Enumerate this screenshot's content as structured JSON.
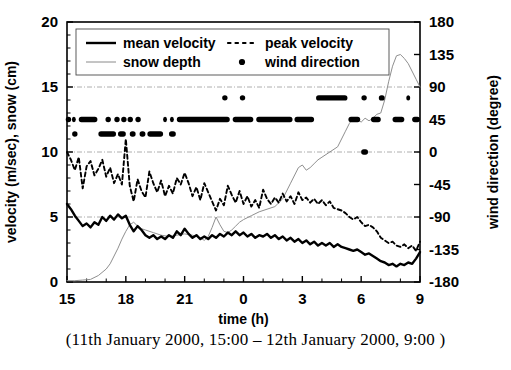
{
  "figure": {
    "caption": "(11th January 2000, 15:00 – 12th January 2000, 9:00 )"
  },
  "chart_data": {
    "type": "line",
    "title": "",
    "xlabel": "time (h)",
    "ylabel": "velocity (m/sec), snow (cm)",
    "y2label": "wind direction (degree)",
    "xlim": [
      15,
      33
    ],
    "ylim": [
      0,
      20
    ],
    "y2lim": [
      -180,
      180
    ],
    "xticks": [
      15,
      18,
      21,
      24,
      27,
      30,
      33
    ],
    "xticklabels": [
      "15",
      "18",
      "21",
      "0",
      "3",
      "6",
      "9"
    ],
    "yticks": [
      0,
      5,
      10,
      15,
      20
    ],
    "yticklabels": [
      "0",
      "5",
      "10",
      "15",
      "20"
    ],
    "y2ticks": [
      -180,
      -135,
      -90,
      -45,
      0,
      45,
      90,
      135,
      180
    ],
    "y2ticklabels": [
      "-180",
      "-135",
      "-90",
      "-45",
      "0",
      "45",
      "90",
      "135",
      "180"
    ],
    "grid": true,
    "gridlines_y": [
      5,
      10,
      15
    ],
    "legend_position": "upper-left-inside",
    "legend": [
      {
        "label": "mean velocity",
        "style": "solid-thick",
        "color": "#000000"
      },
      {
        "label": "peak velocity",
        "style": "dotted",
        "color": "#000000"
      },
      {
        "label": "snow depth",
        "style": "thin-light",
        "color": "#8a8a8a"
      },
      {
        "label": "wind direction",
        "style": "dot-marker",
        "color": "#000000"
      }
    ],
    "series": [
      {
        "name": "mean velocity",
        "axis": "left",
        "x": [
          15.0,
          15.2,
          15.4,
          15.6,
          15.8,
          16.0,
          16.2,
          16.4,
          16.6,
          16.8,
          17.0,
          17.2,
          17.4,
          17.6,
          17.8,
          18.0,
          18.2,
          18.4,
          18.6,
          18.8,
          19.0,
          19.2,
          19.4,
          19.6,
          19.8,
          20.0,
          20.2,
          20.4,
          20.6,
          20.8,
          21.0,
          21.2,
          21.4,
          21.6,
          21.8,
          22.0,
          22.2,
          22.4,
          22.6,
          22.8,
          23.0,
          23.2,
          23.4,
          23.6,
          23.8,
          24.0,
          24.2,
          24.4,
          24.6,
          24.8,
          25.0,
          25.2,
          25.4,
          25.6,
          25.8,
          26.0,
          26.2,
          26.4,
          26.6,
          26.8,
          27.0,
          27.2,
          27.4,
          27.6,
          27.8,
          28.0,
          28.2,
          28.4,
          28.6,
          28.8,
          29.0,
          29.2,
          29.4,
          29.6,
          29.8,
          30.0,
          30.2,
          30.4,
          30.6,
          30.8,
          31.0,
          31.2,
          31.4,
          31.6,
          31.8,
          32.0,
          32.2,
          32.4,
          32.6,
          32.8,
          33.0
        ],
        "values": [
          6.0,
          5.6,
          5.1,
          4.7,
          4.3,
          4.5,
          4.2,
          4.6,
          4.4,
          5.0,
          4.7,
          5.1,
          4.8,
          5.2,
          4.9,
          5.1,
          4.4,
          3.9,
          4.3,
          4.0,
          3.6,
          3.4,
          3.6,
          3.3,
          3.5,
          3.3,
          3.6,
          3.4,
          3.9,
          3.6,
          4.1,
          3.7,
          3.4,
          3.6,
          3.3,
          3.5,
          3.3,
          3.6,
          3.4,
          3.7,
          3.5,
          3.8,
          3.6,
          3.9,
          3.6,
          3.8,
          3.5,
          3.7,
          3.4,
          3.6,
          3.5,
          3.7,
          3.4,
          3.6,
          3.3,
          3.5,
          3.2,
          3.4,
          3.1,
          3.3,
          3.0,
          3.2,
          2.9,
          3.1,
          2.8,
          3.0,
          2.8,
          3.0,
          2.7,
          2.9,
          2.7,
          2.6,
          2.5,
          2.4,
          2.5,
          2.3,
          2.1,
          2.2,
          2.0,
          1.8,
          1.6,
          1.5,
          1.3,
          1.4,
          1.2,
          1.4,
          1.3,
          1.5,
          1.4,
          1.8,
          2.3
        ]
      },
      {
        "name": "peak velocity",
        "axis": "left",
        "x": [
          15.0,
          15.2,
          15.4,
          15.6,
          15.8,
          16.0,
          16.2,
          16.4,
          16.6,
          16.8,
          17.0,
          17.2,
          17.4,
          17.6,
          17.8,
          18.0,
          18.2,
          18.4,
          18.6,
          18.8,
          19.0,
          19.2,
          19.4,
          19.6,
          19.8,
          20.0,
          20.2,
          20.4,
          20.6,
          20.8,
          21.0,
          21.2,
          21.4,
          21.6,
          21.8,
          22.0,
          22.2,
          22.4,
          22.6,
          22.8,
          23.0,
          23.2,
          23.4,
          23.6,
          23.8,
          24.0,
          24.2,
          24.4,
          24.6,
          24.8,
          25.0,
          25.2,
          25.4,
          25.6,
          25.8,
          26.0,
          26.2,
          26.4,
          26.6,
          26.8,
          27.0,
          27.2,
          27.4,
          27.6,
          27.8,
          28.0,
          28.2,
          28.4,
          28.6,
          28.8,
          29.0,
          29.2,
          29.4,
          29.6,
          29.8,
          30.0,
          30.2,
          30.4,
          30.6,
          30.8,
          31.0,
          31.2,
          31.4,
          31.6,
          31.8,
          32.0,
          32.2,
          32.4,
          32.6,
          32.8,
          33.0
        ],
        "values": [
          10.0,
          9.4,
          8.6,
          9.6,
          7.2,
          8.9,
          9.3,
          8.2,
          8.7,
          9.4,
          8.1,
          8.8,
          7.6,
          8.3,
          7.5,
          11.0,
          7.4,
          6.2,
          7.9,
          7.0,
          6.5,
          8.5,
          7.6,
          6.9,
          7.8,
          6.6,
          7.4,
          6.8,
          8.0,
          7.5,
          8.4,
          7.6,
          6.6,
          7.3,
          6.3,
          7.6,
          6.9,
          6.2,
          5.5,
          6.4,
          5.9,
          7.4,
          6.7,
          6.1,
          7.0,
          6.0,
          6.6,
          5.8,
          6.3,
          5.7,
          7.1,
          6.4,
          6.0,
          6.5,
          6.1,
          6.8,
          6.2,
          6.6,
          6.0,
          6.9,
          6.3,
          6.5,
          6.1,
          6.4,
          6.0,
          6.3,
          5.9,
          6.2,
          5.7,
          5.6,
          5.5,
          5.3,
          5.0,
          4.8,
          5.0,
          4.6,
          4.3,
          4.4,
          4.2,
          3.9,
          3.4,
          3.2,
          3.0,
          3.1,
          2.8,
          2.7,
          2.9,
          2.6,
          2.8,
          2.4,
          3.1
        ]
      },
      {
        "name": "snow depth",
        "axis": "left",
        "x": [
          15.0,
          15.4,
          15.8,
          16.2,
          16.6,
          17.0,
          17.2,
          17.4,
          17.6,
          17.8,
          18.0,
          18.2,
          18.4,
          18.6,
          18.8,
          19.0,
          19.4,
          19.8,
          20.2,
          20.6,
          21.0,
          21.4,
          21.8,
          22.0,
          22.2,
          22.4,
          22.6,
          22.8,
          23.0,
          23.2,
          23.4,
          23.6,
          23.8,
          24.0,
          24.4,
          24.8,
          25.2,
          25.6,
          26.0,
          26.4,
          26.8,
          27.0,
          27.2,
          27.4,
          27.6,
          27.8,
          28.0,
          28.4,
          28.8,
          29.0,
          29.2,
          29.4,
          29.6,
          29.8,
          30.0,
          30.2,
          30.4,
          30.6,
          30.8,
          31.0,
          31.2,
          31.4,
          31.6,
          31.8,
          32.0,
          32.2,
          32.4,
          32.8,
          33.0
        ],
        "values": [
          0.1,
          0.1,
          0.15,
          0.2,
          0.5,
          1.0,
          1.4,
          2.0,
          2.6,
          3.3,
          3.9,
          4.4,
          4.6,
          4.3,
          4.1,
          4.0,
          3.8,
          3.6,
          3.5,
          3.6,
          3.7,
          3.6,
          3.4,
          3.2,
          3.5,
          4.2,
          5.0,
          4.4,
          3.9,
          3.8,
          4.0,
          4.3,
          4.6,
          4.8,
          5.1,
          5.4,
          5.6,
          5.8,
          6.4,
          7.6,
          8.8,
          9.0,
          8.6,
          8.8,
          9.1,
          9.4,
          9.6,
          10.0,
          10.4,
          11.0,
          11.6,
          12.2,
          12.6,
          12.5,
          12.3,
          12.6,
          12.4,
          12.6,
          12.9,
          13.0,
          14.0,
          15.4,
          16.6,
          17.4,
          17.5,
          17.2,
          16.8,
          15.6,
          15.0
        ]
      }
    ],
    "wind_direction_points": {
      "name": "wind direction",
      "axis": "right",
      "marker": "filled-circle",
      "segments": [
        {
          "degree": 45,
          "ranges": [
            [
              15.0,
              15.15
            ],
            [
              15.25,
              15.45
            ],
            [
              15.6,
              16.55
            ],
            [
              17.05,
              17.15
            ],
            [
              17.5,
              17.6
            ],
            [
              17.85,
              17.95
            ],
            [
              18.15,
              18.3
            ],
            [
              18.55,
              18.7
            ],
            [
              19.9,
              20.1
            ],
            [
              20.25,
              20.45
            ],
            [
              20.6,
              23.3
            ],
            [
              23.45,
              24.5
            ],
            [
              24.65,
              26.5
            ],
            [
              26.6,
              27.6
            ],
            [
              29.35,
              29.95
            ],
            [
              30.5,
              31.0
            ],
            [
              31.6,
              32.2
            ],
            [
              32.6,
              33.0
            ]
          ]
        },
        {
          "degree": 25,
          "ranges": [
            [
              15.35,
              15.45
            ],
            [
              16.6,
              17.5
            ],
            [
              17.6,
              18.0
            ],
            [
              18.2,
              18.5
            ],
            [
              18.7,
              19.0
            ],
            [
              19.1,
              19.9
            ],
            [
              20.2,
              20.55
            ]
          ]
        },
        {
          "degree": 75,
          "ranges": [
            [
              23.0,
              23.1
            ],
            [
              23.9,
              24.0
            ],
            [
              27.7,
              29.3
            ],
            [
              30.1,
              30.2
            ],
            [
              30.9,
              31.2
            ],
            [
              32.3,
              32.5
            ]
          ]
        },
        {
          "degree": 0,
          "ranges": [
            [
              30.0,
              30.35
            ]
          ]
        }
      ]
    }
  }
}
